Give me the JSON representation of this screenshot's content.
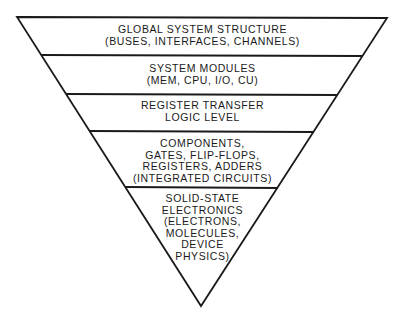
{
  "diagram": {
    "type": "inverted-pyramid",
    "colors": {
      "stroke": "#1a1a1a",
      "fill": "#ffffff",
      "text": "#1a1a1a"
    },
    "levels": [
      {
        "id": "global-system-structure",
        "lines": [
          "GLOBAL SYSTEM STRUCTURE",
          "(BUSES, INTERFACES, CHANNELS)"
        ]
      },
      {
        "id": "system-modules",
        "lines": [
          "SYSTEM MODULES",
          "(MEM, CPU, I/O, CU)"
        ]
      },
      {
        "id": "register-transfer",
        "lines": [
          "REGISTER TRANSFER",
          "LOGIC LEVEL"
        ]
      },
      {
        "id": "components",
        "lines": [
          "COMPONENTS,",
          "GATES, FLIP-FLOPS,",
          "REGISTERS, ADDERS",
          "(INTEGRATED CIRCUITS)"
        ]
      },
      {
        "id": "solid-state-electronics",
        "lines": [
          "SOLID-STATE",
          "ELECTRONICS",
          "(ELECTRONS,",
          "MOLECULES,",
          "DEVICE",
          "PHYSICS)"
        ]
      }
    ]
  }
}
